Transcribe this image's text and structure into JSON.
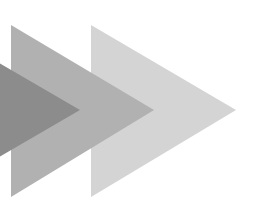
{
  "graphic": {
    "description": "Three overlapping right-pointing triangles (arrow/chevron motif) in graded grays",
    "shapes": [
      {
        "name": "light-triangle",
        "points": "91,25 236,110 91,197",
        "color": "#d4d4d4"
      },
      {
        "name": "medium-triangle",
        "points": "11,25 154,110 11,197",
        "color": "#b1b1b1"
      },
      {
        "name": "dark-triangle",
        "points": "-20,52 80,110 -20,168",
        "color": "#8c8c8c"
      }
    ],
    "background": "#ffffff"
  }
}
